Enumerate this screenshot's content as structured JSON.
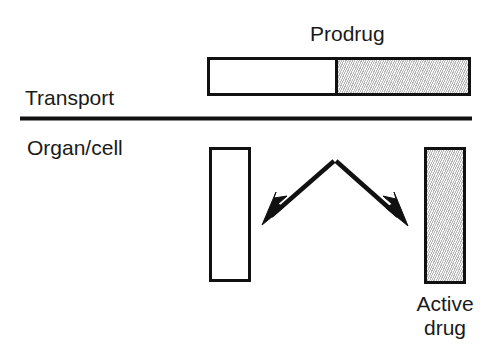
{
  "figure": {
    "type": "schematic-diagram",
    "background_color": "#ffffff",
    "stroke_color": "#111111",
    "shaded_fill_color": "#c9c9c9"
  },
  "labels": {
    "prodrug": "Prodrug",
    "transport": "Transport",
    "organ_cell": "Organ/cell",
    "active_drug_line1": "Active",
    "active_drug_line2": "drug"
  },
  "shapes": {
    "prodrug_bar": {
      "name": "prodrug-bar",
      "white_segment": "carrier/promoiety",
      "shaded_segment": "active moiety"
    },
    "organ_box_white": {
      "name": "organ-box-white",
      "fill": "white"
    },
    "organ_box_shaded": {
      "name": "organ-box-shaded",
      "fill": "shaded"
    }
  },
  "arrows": [
    {
      "name": "cleavage-arrow-left",
      "direction": "down-left",
      "from": [
        335,
        160
      ],
      "to": [
        263,
        224
      ]
    },
    {
      "name": "cleavage-arrow-right",
      "direction": "down-right",
      "from": [
        335,
        160
      ],
      "to": [
        407,
        225
      ]
    }
  ],
  "divider": {
    "name": "membrane-divider-line",
    "orientation": "horizontal",
    "y": 118,
    "x_start": 20,
    "x_end": 472
  }
}
